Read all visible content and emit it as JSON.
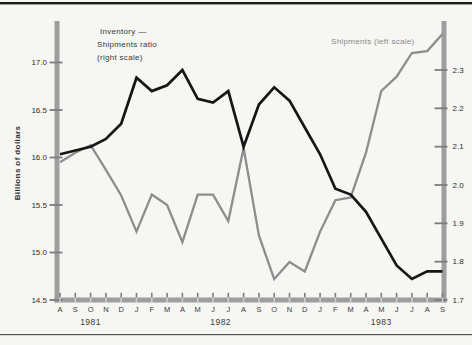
{
  "page": {
    "background": "#f6f6f3",
    "top_rule_color": "#1a1a1a",
    "bottom_rule_color": "#555555"
  },
  "chart_data": {
    "type": "line",
    "title": "",
    "ylabel_left": "Billions of dollars",
    "x_months": [
      "A",
      "S",
      "O",
      "N",
      "D",
      "J",
      "F",
      "M",
      "A",
      "M",
      "J",
      "J",
      "A",
      "S",
      "O",
      "N",
      "D",
      "J",
      "F",
      "M",
      "A",
      "M",
      "J",
      "J",
      "A",
      "S"
    ],
    "x_years": [
      {
        "label": "1981",
        "month_count": 5
      },
      {
        "label": "1982",
        "month_count": 12
      },
      {
        "label": "1983",
        "month_count": 9
      }
    ],
    "left_axis": {
      "ticks": [
        14.5,
        15.0,
        15.5,
        16.0,
        16.5,
        17.0
      ],
      "range": [
        14.5,
        17.45
      ]
    },
    "right_axis": {
      "ticks": [
        1.7,
        1.8,
        1.9,
        2.0,
        2.1,
        2.2,
        2.3
      ],
      "range": [
        1.7,
        2.43
      ]
    },
    "grid": "off",
    "series": [
      {
        "name": "Shipments (left scale)",
        "axis": "left",
        "color": "#8d8d8d",
        "values": [
          15.95,
          16.05,
          16.13,
          15.87,
          15.6,
          15.22,
          15.61,
          15.5,
          15.11,
          15.61,
          15.61,
          15.33,
          16.1,
          15.18,
          14.72,
          14.9,
          14.8,
          15.22,
          15.55,
          15.58,
          16.05,
          16.7,
          16.85,
          17.1,
          17.12,
          17.3
        ]
      },
      {
        "name": "Inventory — Shipments ratio (right scale)",
        "axis": "right",
        "color": "#161616",
        "values": [
          2.08,
          2.09,
          2.1,
          2.12,
          2.16,
          2.28,
          2.245,
          2.26,
          2.3,
          2.225,
          2.215,
          2.245,
          2.1,
          2.21,
          2.255,
          2.22,
          2.15,
          2.08,
          1.99,
          1.975,
          1.93,
          1.86,
          1.79,
          1.755,
          1.775,
          1.775
        ]
      }
    ],
    "annotations": {
      "ratio_label_lines": [
        "Inventory —",
        "Shipments ratio",
        "(right scale)"
      ],
      "shipments_label": "Shipments (left scale)"
    },
    "axis_color": "#9e9e9e",
    "tick_color": "#7d7d7d",
    "label_color": "#2e2e2e"
  }
}
